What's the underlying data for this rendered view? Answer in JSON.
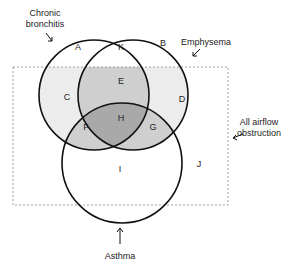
{
  "diagram": {
    "type": "venn",
    "sets": [
      {
        "name": "Chronic bronchitis",
        "label_lines": [
          "Chronic",
          "bronchitis"
        ]
      },
      {
        "name": "Emphysema",
        "label_lines": [
          "Emphysema"
        ]
      },
      {
        "name": "Asthma",
        "label_lines": [
          "Asthma"
        ]
      },
      {
        "name": "All airflow obstruction",
        "label_lines": [
          "All airflow",
          "obstruction"
        ],
        "style": "dashed-rectangle"
      }
    ],
    "regions": {
      "A": "A",
      "B": "B",
      "K": "K",
      "E": "E",
      "C": "C",
      "D": "D",
      "F": "F",
      "H": "H",
      "G": "G",
      "I": "I",
      "J": "J"
    },
    "colors": {
      "light_fill": "#ececec",
      "mid_fill": "#cfcfcf",
      "dark_fill": "#a9a9a9",
      "stroke": "#111111",
      "dashed": "#888888"
    }
  }
}
